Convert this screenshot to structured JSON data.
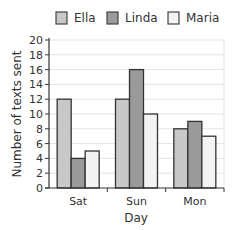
{
  "chart_data": {
    "type": "bar",
    "title": "",
    "xlabel": "Day",
    "ylabel": "Number of texts sent",
    "categories": [
      "Sat",
      "Sun",
      "Mon"
    ],
    "series": [
      {
        "name": "Ella",
        "values": [
          12,
          12,
          8
        ],
        "color": "#c8c8c8"
      },
      {
        "name": "Linda",
        "values": [
          4,
          16,
          9
        ],
        "color": "#9a9a9a"
      },
      {
        "name": "Maria",
        "values": [
          5,
          10,
          7
        ],
        "color": "#f3f3f3"
      }
    ],
    "ylim": [
      0,
      20
    ],
    "yticks": [
      0,
      2,
      4,
      6,
      8,
      10,
      12,
      14,
      16,
      18,
      20
    ],
    "grid": true,
    "legend_position": "top"
  },
  "legend": {
    "items": [
      {
        "label": "Ella",
        "color": "#c8c8c8"
      },
      {
        "label": "Linda",
        "color": "#9a9a9a"
      },
      {
        "label": "Maria",
        "color": "#f3f3f3"
      }
    ]
  }
}
